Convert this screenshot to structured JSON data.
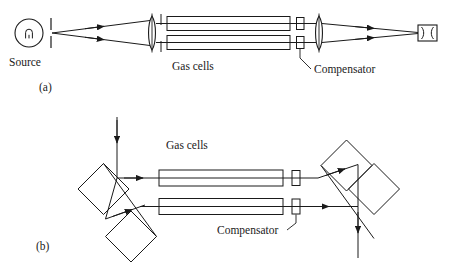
{
  "figure": {
    "type": "diagram",
    "stroke_color": "#1a1a1a",
    "background_color": "#ffffff",
    "text_color": "#1a1a1a"
  },
  "panel_a": {
    "caption": "(a)",
    "source_label": "Source",
    "gas_cells_label": "Gas cells",
    "compensator_label": "Compensator",
    "components": {
      "source_lamp": "lamp-filament-circle",
      "entrance_slit": "slit",
      "collimating_lens": "lens",
      "field_slit": "slit",
      "gas_cell_upper": "gas-cell",
      "gas_cell_lower": "gas-cell",
      "compensator_upper": "compensator-plate",
      "compensator_lower": "compensator-plate",
      "focusing_lens": "lens",
      "eyepiece": "eyepiece-telescope"
    }
  },
  "panel_b": {
    "caption": "(b)",
    "gas_cells_label": "Gas cells",
    "compensator_label": "Compensator",
    "components": {
      "input_beam": "beam-arrow-down",
      "beam_splitter_prism": "jamin-prism-pair",
      "gas_cell_upper": "gas-cell",
      "gas_cell_lower": "gas-cell",
      "compensator_upper": "compensator-plate",
      "compensator_lower": "compensator-plate",
      "recombiner_prism": "jamin-prism-pair",
      "output_beam": "beam-arrow-down"
    }
  }
}
